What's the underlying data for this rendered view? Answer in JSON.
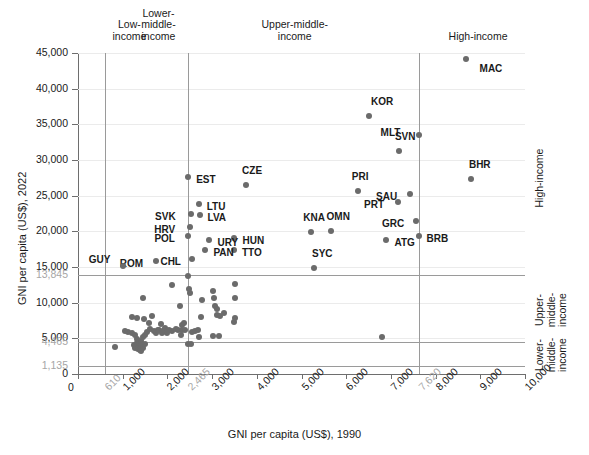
{
  "chart_data": {
    "type": "scatter",
    "title": "",
    "xlabel": "GNI per capita (US$), 1990",
    "ylabel": "GNI per capita (US$), 2022",
    "xlim": [
      0,
      10000
    ],
    "ylim": [
      0,
      45000
    ],
    "grid": true,
    "legend_position": "none",
    "x_ticks": [
      "0",
      "1,000",
      "2,000",
      "3,000",
      "4,000",
      "5,000",
      "6,000",
      "7,000",
      "8,000",
      "9,000",
      "10,000"
    ],
    "x_threshold_ticks": [
      "610",
      "2,465",
      "7,620"
    ],
    "y_ticks": [
      "0",
      "5,000",
      "10,000",
      "15,000",
      "20,000",
      "25,000",
      "30,000",
      "35,000",
      "40,000",
      "45,000"
    ],
    "y_threshold_ticks": [
      "1,135",
      "4,465",
      "13,845"
    ],
    "x_thresholds": [
      610,
      2465,
      7620
    ],
    "y_thresholds": [
      1135,
      4465,
      13845
    ],
    "top_categories": [
      {
        "label": "Low-\nincome",
        "x": 1150
      },
      {
        "label": "Lower-\nmiddle-\nincome",
        "x": 1800
      },
      {
        "label": "Upper-middle-\nincome",
        "x": 4850
      },
      {
        "label": "High-income",
        "x": 8950
      }
    ],
    "right_categories": [
      {
        "label": "Lower-\nmiddle-\nincome",
        "y": 2700
      },
      {
        "label": "Upper-\nmiddle-\nincome",
        "y": 9000
      },
      {
        "label": "High-income",
        "y": 27500
      }
    ],
    "labeled_points": [
      {
        "code": "MAC",
        "x": 8670,
        "y": 44200,
        "lx": 14,
        "ly": 10
      },
      {
        "code": "KOR",
        "x": 6510,
        "y": 36100,
        "lx": 2,
        "ly": -14
      },
      {
        "code": "MLT",
        "x": 7620,
        "y": 33500,
        "lx": -38,
        "ly": -2
      },
      {
        "code": "SVN",
        "x": 7180,
        "y": 31300,
        "lx": -4,
        "ly": -14
      },
      {
        "code": "BHR",
        "x": 8790,
        "y": 27300,
        "lx": -2,
        "ly": -14
      },
      {
        "code": "CZE",
        "x": 3760,
        "y": 26500,
        "lx": -4,
        "ly": -14
      },
      {
        "code": "EST",
        "x": 2465,
        "y": 27600,
        "lx": 8,
        "ly": 3
      },
      {
        "code": "SAU",
        "x": 7430,
        "y": 25300,
        "lx": -34,
        "ly": 3
      },
      {
        "code": "PRI",
        "x": 6260,
        "y": 25600,
        "lx": -6,
        "ly": -14
      },
      {
        "code": "PRT",
        "x": 7160,
        "y": 24100,
        "lx": -34,
        "ly": 3
      },
      {
        "code": "LTU",
        "x": 2700,
        "y": 23800,
        "lx": 8,
        "ly": 3
      },
      {
        "code": "LVA",
        "x": 2720,
        "y": 22300,
        "lx": 8,
        "ly": 3
      },
      {
        "code": "SVK",
        "x": 2530,
        "y": 22500,
        "lx": -36,
        "ly": 3
      },
      {
        "code": "GRC",
        "x": 7560,
        "y": 21400,
        "lx": -34,
        "ly": 3
      },
      {
        "code": "KNA",
        "x": 5220,
        "y": 19900,
        "lx": -8,
        "ly": -14
      },
      {
        "code": "OMN",
        "x": 5650,
        "y": 20100,
        "lx": -4,
        "ly": -14
      },
      {
        "code": "HRV",
        "x": 2510,
        "y": 20600,
        "lx": -36,
        "ly": 3
      },
      {
        "code": "BRB",
        "x": 7620,
        "y": 19400,
        "lx": 8,
        "ly": 3
      },
      {
        "code": "HUN",
        "x": 3500,
        "y": 19100,
        "lx": 8,
        "ly": 3
      },
      {
        "code": "ATG",
        "x": 6900,
        "y": 18800,
        "lx": 8,
        "ly": 3
      },
      {
        "code": "POL",
        "x": 2470,
        "y": 19300,
        "lx": -34,
        "ly": 3
      },
      {
        "code": "URY",
        "x": 2940,
        "y": 18800,
        "lx": 8,
        "ly": 3
      },
      {
        "code": "TTO",
        "x": 3490,
        "y": 17400,
        "lx": 8,
        "ly": 3
      },
      {
        "code": "PAN",
        "x": 2850,
        "y": 17400,
        "lx": 8,
        "ly": 3
      },
      {
        "code": "SYC",
        "x": 5280,
        "y": 14800,
        "lx": -2,
        "ly": -14
      },
      {
        "code": "CHL",
        "x": 2560,
        "y": 16100,
        "lx": -32,
        "ly": 3
      },
      {
        "code": "ROM",
        "x": 1740,
        "y": 15900,
        "lx": -36,
        "ly": 3
      },
      {
        "code": "GUY",
        "x": 1000,
        "y": 15200,
        "lx": -34,
        "ly": -6
      }
    ],
    "unlabeled_points": [
      [
        6800,
        5200
      ],
      [
        3520,
        12600
      ],
      [
        3520,
        10600
      ],
      [
        2470,
        13800
      ],
      [
        2480,
        11900
      ],
      [
        2500,
        11300
      ],
      [
        3020,
        11700
      ],
      [
        3050,
        10600
      ],
      [
        3060,
        9500
      ],
      [
        3110,
        9100
      ],
      [
        3120,
        8300
      ],
      [
        3180,
        8100
      ],
      [
        2770,
        10400
      ],
      [
        2760,
        8000
      ],
      [
        3520,
        7900
      ],
      [
        3480,
        7300
      ],
      [
        2110,
        12500
      ],
      [
        2290,
        9600
      ],
      [
        1660,
        8100
      ],
      [
        1470,
        7700
      ],
      [
        1580,
        7200
      ],
      [
        1200,
        8000
      ],
      [
        1330,
        7900
      ],
      [
        1450,
        10700
      ],
      [
        1850,
        7000
      ],
      [
        1950,
        6500
      ],
      [
        2110,
        6000
      ],
      [
        2190,
        6300
      ],
      [
        2240,
        6200
      ],
      [
        2320,
        6100
      ],
      [
        2400,
        6200
      ],
      [
        2560,
        5900
      ],
      [
        2620,
        6000
      ],
      [
        1120,
        5900
      ],
      [
        1210,
        5700
      ],
      [
        1280,
        5500
      ],
      [
        1320,
        4900
      ],
      [
        1330,
        4400
      ],
      [
        1360,
        4100
      ],
      [
        1400,
        3900
      ],
      [
        1420,
        4600
      ],
      [
        1450,
        5200
      ],
      [
        1500,
        5400
      ],
      [
        1550,
        5900
      ],
      [
        1600,
        6300
      ],
      [
        1700,
        6000
      ],
      [
        1740,
        5700
      ],
      [
        1780,
        6100
      ],
      [
        1820,
        6200
      ],
      [
        1870,
        5800
      ],
      [
        1900,
        6000
      ],
      [
        2000,
        5800
      ],
      [
        2040,
        6100
      ],
      [
        2300,
        5400
      ],
      [
        2680,
        6100
      ],
      [
        2700,
        5200
      ],
      [
        3030,
        5300
      ],
      [
        3150,
        5300
      ],
      [
        3260,
        8500
      ],
      [
        820,
        3800
      ],
      [
        1250,
        4100
      ],
      [
        1280,
        3700
      ],
      [
        1340,
        3500
      ],
      [
        1380,
        3300
      ],
      [
        1420,
        3200
      ],
      [
        1460,
        3600
      ],
      [
        1500,
        4200
      ],
      [
        2460,
        4200
      ],
      [
        2520,
        4200
      ],
      [
        2330,
        6800
      ],
      [
        2380,
        7200
      ],
      [
        1050,
        6000
      ]
    ]
  }
}
